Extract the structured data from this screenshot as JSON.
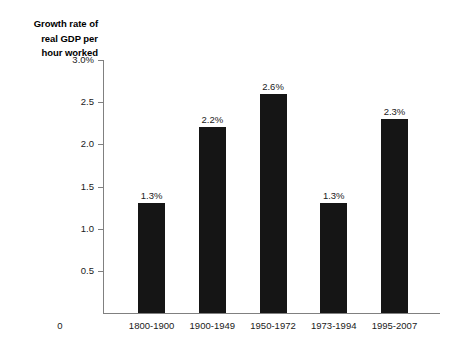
{
  "chart_data": {
    "type": "bar",
    "title": "",
    "xlabel": "",
    "ylabel": "Growth rate of real GDP per hour worked",
    "ylabel_lines": [
      "Growth rate of",
      "real GDP per",
      "hour worked"
    ],
    "categories": [
      "1800-1900",
      "1900-1949",
      "1950-1972",
      "1973-1994",
      "1995-2007"
    ],
    "values": [
      1.3,
      2.2,
      2.6,
      1.3,
      2.3
    ],
    "value_labels": [
      "1.3%",
      "2.2%",
      "2.6%",
      "1.3%",
      "2.3%"
    ],
    "ylim": [
      0,
      3.0
    ],
    "ytick_values": [
      3.0,
      2.5,
      2.0,
      1.5,
      1.0,
      0.5
    ],
    "ytick_labels": [
      "3.0%",
      "2.5",
      "2.0",
      "1.5",
      "1.0",
      "0.5"
    ],
    "origin_label": "0",
    "grid": false,
    "legend": false,
    "bar_color": "#151515",
    "axis_color": "#808080",
    "text_color": "#1a1a1a"
  }
}
